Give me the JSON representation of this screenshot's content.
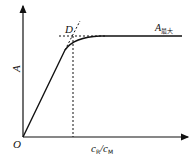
{
  "diagram": {
    "type": "saturation-curve",
    "axes": {
      "origin_label": "O",
      "y_label": "A",
      "x_label_main": "c",
      "x_label_sub1": "R",
      "x_label_sep": "/c",
      "x_label_sub2": "M"
    },
    "annotations": {
      "point_label": "D",
      "max_label_main": "A",
      "max_label_sub": "最大"
    },
    "colors": {
      "line": "#111111",
      "background": "#ffffff"
    }
  }
}
